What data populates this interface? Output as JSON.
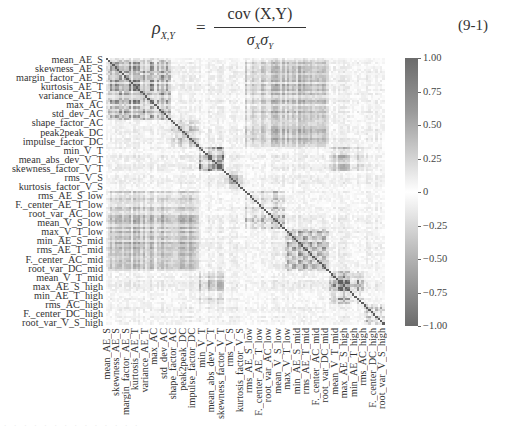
{
  "equation": {
    "lhs_symbol": "ρ",
    "lhs_subscript": "X,Y",
    "equals": "=",
    "numerator": "cov (X,Y)",
    "denominator_sigma1": "σ",
    "denominator_sub1": "X",
    "denominator_sigma2": "σ",
    "denominator_sub2": "Y",
    "number": "(9-1)"
  },
  "chart_data": {
    "type": "heatmap",
    "title": "",
    "xlabel": "",
    "ylabel": "",
    "labels": [
      "mean_AE_S",
      "skewness_AE_S",
      "margin_factor_AE_S",
      "kurtosis_AE_T",
      "variance_AE_T",
      "max_AC",
      "std_dev_AC",
      "shape_factor_AC",
      "peak2peak_DC",
      "impulse_factor_DC",
      "min_V_T",
      "mean_abs_dev_V_T",
      "skewness_factor_V_T",
      "rms_V_S",
      "kurtosis_factor_V_S",
      "rms_AE_S_low",
      "F._center_AE_T_low",
      "root_var_AC_low",
      "mean_V_S_low",
      "max_V_T_low",
      "min_AE_S_mid",
      "rms_AE_T_mid",
      "F._center_AC_mid",
      "root_var_DC_mid",
      "mean_V_T_mid",
      "max_AE_S_high",
      "min_AE_T_high",
      "rms_AC_high",
      "F._center_DC_high",
      "root_var_V_S_high"
    ],
    "ylabels_visible": [
      "mean_AE_S",
      "skewness_AE_S",
      "margin_factor_AE_S",
      "kurtosis_AE_T",
      "variance_AE_T",
      "max_AC",
      "std_dev_AC",
      "shape_factor_AC",
      "peak2peak_DC",
      "impulse_factor_DC",
      "min_V_T",
      "mean_abs_dev_V_T",
      "skewness_factor_V_T",
      "rms_V_S",
      "kurtosis_factor_V_S",
      "rms_AE_S_low",
      "F._center_AE_T_low",
      "root_var_AC_low",
      "mean_V_S_low",
      "max_V_T_low",
      "min_AE_S_mid",
      "rms_AE_T_mid",
      "F._center_AC_mid",
      "root_var_DC_mid",
      "mean_V_T_mid",
      "max_AE_S_high",
      "min_AE_T_high",
      "rms_AC_high",
      "F._center_DC_high",
      "root_var_V_S_high"
    ],
    "n_features_approx": 120,
    "diagonal_value": 1.0,
    "blocks": [
      {
        "group": "AE/AC time-domain (mean_AE_S..std_dev_AC)",
        "range": [
          0.0,
          0.23
        ],
        "mean_corr": 0.6
      },
      {
        "group": "DC / V_T transition (peak2peak_DC..min_V_T)",
        "range": [
          0.23,
          0.33
        ],
        "mean_corr": 0.35
      },
      {
        "group": "V_T block (mean_abs_dev_V_T..skewness_factor_V_T)",
        "range": [
          0.33,
          0.42
        ],
        "mean_corr": 0.8
      },
      {
        "group": "V_S block (rms_V_S..kurtosis_factor_V_S)",
        "range": [
          0.42,
          0.5
        ],
        "mean_corr": 0.5
      },
      {
        "group": "low band (rms_AE_S_low..max_V_T_low)",
        "range": [
          0.5,
          0.64
        ],
        "mean_corr": 0.45
      },
      {
        "group": "mid band (min_AE_S_mid..mean_V_T_mid)",
        "range": [
          0.64,
          0.8
        ],
        "mean_corr": 0.55
      },
      {
        "group": "high AE (max_AE_S_high..min_AE_T_high)",
        "range": [
          0.8,
          0.92
        ],
        "mean_corr": 0.75
      },
      {
        "group": "high AC/DC/V (rms_AC_high..root_var_V_S_high)",
        "range": [
          0.92,
          1.0
        ],
        "mean_corr": 0.5
      }
    ],
    "colormap": "diverging grey (dark = |r|→1, white = 0)",
    "colorbar": {
      "range": [
        -1.0,
        1.0
      ],
      "ticks": [
        "1.00",
        "0.75",
        "0.50",
        "0.25",
        "0",
        "−0.25",
        "−0.50",
        "−0.75",
        "−1.00"
      ]
    },
    "grid": false,
    "legend_position": "right (colorbar)"
  },
  "colors": {
    "strong": "#5f5f5f",
    "zero": "#ffffff",
    "text": "#333333"
  },
  "caption_faint": "· · · · · · · · · · · · · ·"
}
